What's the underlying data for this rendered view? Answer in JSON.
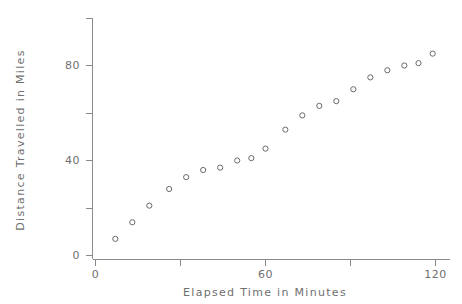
{
  "chart_data": {
    "type": "scatter",
    "title": "",
    "xlabel": "Elapsed Time in Minutes",
    "ylabel": "Distance Travelled in Miles",
    "xlim": [
      0,
      124
    ],
    "ylim": [
      0,
      100
    ],
    "grid": false,
    "legend": null,
    "x_ticks": [
      {
        "value": 0,
        "label": "0"
      },
      {
        "value": 30,
        "label": ""
      },
      {
        "value": 60,
        "label": "60"
      },
      {
        "value": 90,
        "label": ""
      },
      {
        "value": 120,
        "label": "120"
      }
    ],
    "y_ticks": [
      {
        "value": 0,
        "label": "0"
      },
      {
        "value": 20,
        "label": ""
      },
      {
        "value": 40,
        "label": "40"
      },
      {
        "value": 60,
        "label": ""
      },
      {
        "value": 80,
        "label": "80"
      },
      {
        "value": 100,
        "label": ""
      }
    ],
    "marker": "open-circle",
    "marker_color": "#6a6a6a",
    "points": [
      {
        "x": 7,
        "y": 7
      },
      {
        "x": 13,
        "y": 14
      },
      {
        "x": 19,
        "y": 21
      },
      {
        "x": 26,
        "y": 28
      },
      {
        "x": 32,
        "y": 33
      },
      {
        "x": 38,
        "y": 36
      },
      {
        "x": 44,
        "y": 37
      },
      {
        "x": 50,
        "y": 40
      },
      {
        "x": 55,
        "y": 41
      },
      {
        "x": 60,
        "y": 45
      },
      {
        "x": 67,
        "y": 53
      },
      {
        "x": 73,
        "y": 59
      },
      {
        "x": 79,
        "y": 63
      },
      {
        "x": 85,
        "y": 65
      },
      {
        "x": 91,
        "y": 70
      },
      {
        "x": 97,
        "y": 75
      },
      {
        "x": 103,
        "y": 78
      },
      {
        "x": 109,
        "y": 80
      },
      {
        "x": 114,
        "y": 81
      },
      {
        "x": 119,
        "y": 85
      }
    ]
  },
  "labels": {
    "x_axis_title": "Elapsed Time in Minutes",
    "y_axis_title": "Distance Travelled in Miles",
    "y_tick_0": "0",
    "y_tick_40": "40",
    "y_tick_80": "80",
    "x_tick_0": "0",
    "x_tick_60": "60",
    "x_tick_120": "120"
  }
}
